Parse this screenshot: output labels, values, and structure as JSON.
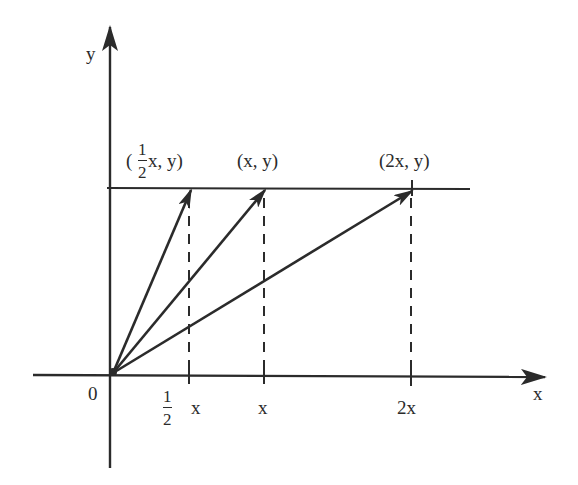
{
  "diagram": {
    "type": "vector-scaling",
    "colors": {
      "ink": "#2b2b2b",
      "background": "#ffffff"
    },
    "axes": {
      "x_label": "x",
      "y_label": "y",
      "origin_label": "0"
    },
    "horizontal_line": {
      "description": "line at height y"
    },
    "points": [
      {
        "label_prefix": "(",
        "frac_num": "1",
        "frac_den": "2",
        "label_suffix": " x, y)"
      },
      {
        "label": "(x, y)"
      },
      {
        "label": "(2x, y)"
      }
    ],
    "x_ticks": [
      {
        "frac_num": "1",
        "frac_den": "2",
        "label": "x"
      },
      {
        "label": "x"
      },
      {
        "label": "2x"
      }
    ]
  }
}
